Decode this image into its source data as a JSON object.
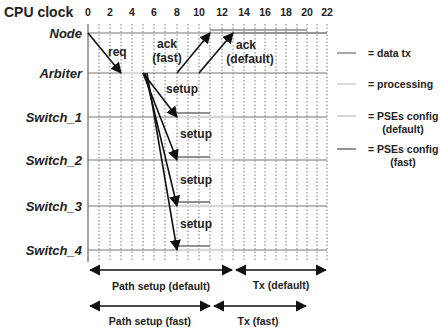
{
  "title": "CPU clock",
  "axis": {
    "ticks": [
      "0",
      "2",
      "4",
      "6",
      "8",
      "10",
      "12",
      "14",
      "16",
      "18",
      "20",
      "22"
    ],
    "min": 0,
    "max": 22
  },
  "rows": [
    {
      "label": "Node"
    },
    {
      "label": "Arbiter"
    },
    {
      "label": "Switch_1"
    },
    {
      "label": "Switch_2"
    },
    {
      "label": "Switch_3"
    },
    {
      "label": "Switch_4"
    }
  ],
  "annotations": {
    "req": "req",
    "ack_fast_1": "ack",
    "ack_fast_2": "(fast)",
    "ack_default_1": "ack",
    "ack_default_2": "(default)",
    "setup": "setup"
  },
  "legend": [
    {
      "label": "= data tx",
      "color": "#8a8a8a"
    },
    {
      "label": "= processing",
      "color": "#dcdcdc"
    },
    {
      "label": "= PSEs config",
      "sublabel": "(default)",
      "color": "#d8d8d8"
    },
    {
      "label": "= PSEs config",
      "sublabel": "(fast)",
      "color": "#6e6e6e"
    }
  ],
  "spans": {
    "path_setup_default": "Path setup (default)",
    "tx_default": "Tx (default)",
    "path_setup_fast": "Path setup (fast)",
    "tx_fast": "Tx  (fast)"
  },
  "colors": {
    "axis_line": "#777777",
    "grid": "#444444",
    "arrow": "#111111"
  }
}
